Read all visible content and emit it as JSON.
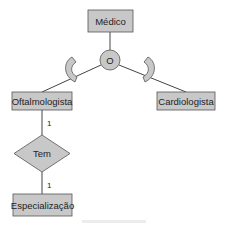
{
  "diagram": {
    "type": "ER specialization diagram",
    "colors": {
      "fill": "#c8c8c8",
      "stroke": "#555555",
      "line": "#444444",
      "background": "#ffffff"
    },
    "entities": [
      {
        "id": "medico",
        "label": "Médico"
      },
      {
        "id": "oftalmologista",
        "label": "Oftalmologista"
      },
      {
        "id": "cardiologista",
        "label": "Cardiologista"
      },
      {
        "id": "especializacao",
        "label": "Especialização"
      }
    ],
    "specialization": {
      "symbol": "O",
      "meaning": "overlapping",
      "parent": "Médico",
      "children": [
        "Oftalmologista",
        "Cardiologista"
      ]
    },
    "relationships": [
      {
        "label": "Tem",
        "from": "Oftalmologista",
        "to": "Especialização",
        "cardinality_from": "1",
        "cardinality_to": "1"
      }
    ]
  }
}
